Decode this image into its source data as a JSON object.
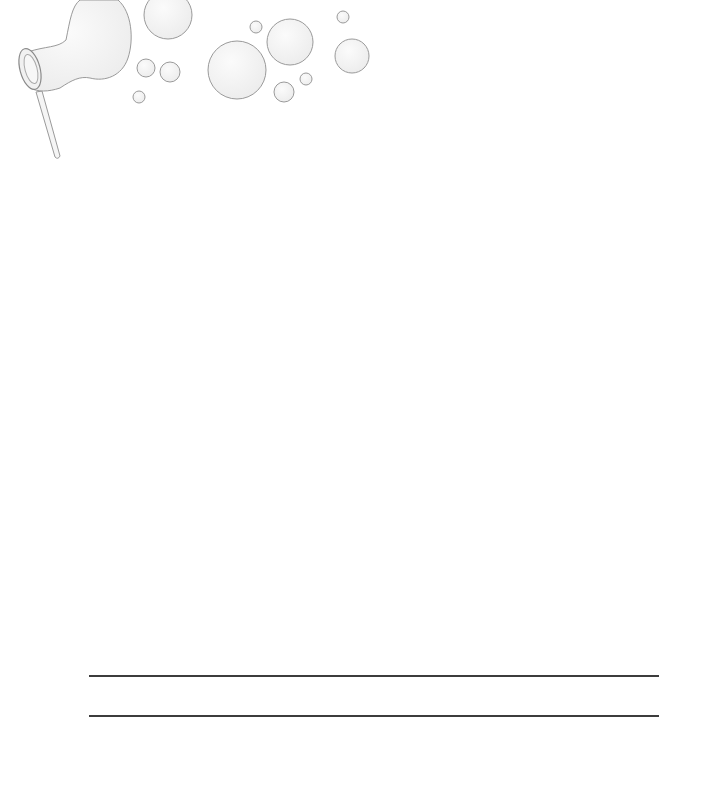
{
  "page": {
    "type": "stationery",
    "background": "#ffffff"
  },
  "decoration": {
    "icon": "bubble-wand-icon",
    "stroke_color": "#9a9a9a",
    "fill_color": "#f3f3f3",
    "bubbles": [
      {
        "cx": 168,
        "cy": 15,
        "r": 24
      },
      {
        "cx": 146,
        "cy": 68,
        "r": 9
      },
      {
        "cx": 170,
        "cy": 72,
        "r": 10
      },
      {
        "cx": 139,
        "cy": 97,
        "r": 6
      },
      {
        "cx": 237,
        "cy": 70,
        "r": 29
      },
      {
        "cx": 256,
        "cy": 27,
        "r": 6
      },
      {
        "cx": 290,
        "cy": 42,
        "r": 23
      },
      {
        "cx": 284,
        "cy": 92,
        "r": 10
      },
      {
        "cx": 306,
        "cy": 79,
        "r": 6
      },
      {
        "cx": 343,
        "cy": 17,
        "r": 6
      },
      {
        "cx": 352,
        "cy": 56,
        "r": 17
      }
    ]
  },
  "writing_lines": {
    "count": 2,
    "color": "#3c3c3c"
  }
}
